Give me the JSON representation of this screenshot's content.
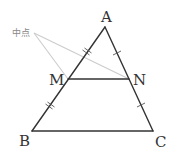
{
  "diagram": {
    "type": "geometry-midpoint-theorem",
    "vertices": {
      "A": {
        "label": "A",
        "x": 105,
        "y": 27
      },
      "B": {
        "label": "B",
        "x": 32,
        "y": 131
      },
      "C": {
        "label": "C",
        "x": 153,
        "y": 131
      },
      "M": {
        "label": "M",
        "x": 68,
        "y": 79
      },
      "N": {
        "label": "N",
        "x": 129,
        "y": 79
      }
    },
    "annotation": {
      "label": "中点",
      "points_to": [
        "M",
        "N"
      ]
    },
    "segments": [
      "AB",
      "AC",
      "BC",
      "MN"
    ],
    "tick_marks": {
      "AM": 2,
      "MB": 2,
      "AN": 1,
      "NC": 1
    },
    "colors": {
      "line": "#333333",
      "leader": "#c8c8c8",
      "annotation_text": "#888888"
    }
  }
}
